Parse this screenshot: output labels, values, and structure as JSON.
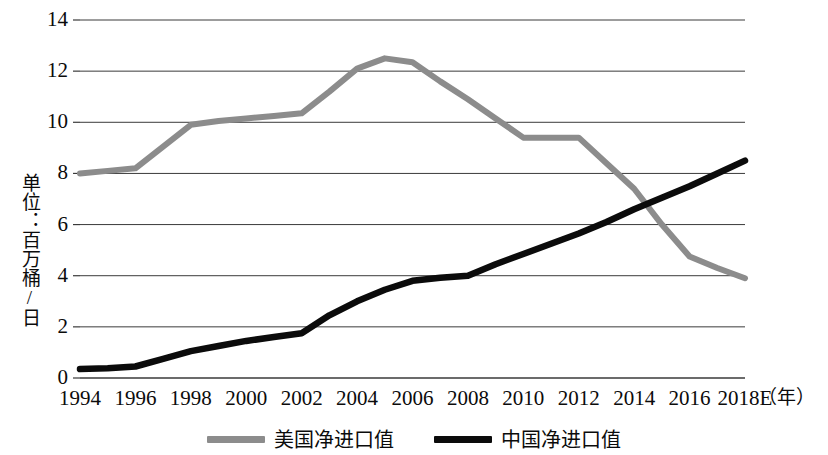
{
  "chart_data": {
    "type": "line",
    "title": "",
    "xlabel": "年",
    "ylabel": "单位：百万桶/日",
    "x": [
      1994,
      1995,
      1996,
      1997,
      1998,
      1999,
      2000,
      2001,
      2002,
      2003,
      2004,
      2005,
      2006,
      2007,
      2008,
      2009,
      2010,
      2011,
      2012,
      2013,
      2014,
      2015,
      2016,
      2017,
      2018
    ],
    "xtick_labels": [
      "1994",
      "1996",
      "1998",
      "2000",
      "2002",
      "2004",
      "2006",
      "2008",
      "2010",
      "2012",
      "2014",
      "2016",
      "2018E"
    ],
    "xtick_values": [
      1994,
      1996,
      1998,
      2000,
      2002,
      2004,
      2006,
      2008,
      2010,
      2012,
      2014,
      2016,
      2018
    ],
    "ytick_labels": [
      "0",
      "2",
      "4",
      "6",
      "8",
      "10",
      "12",
      "14"
    ],
    "ytick_values": [
      0,
      2,
      4,
      6,
      8,
      10,
      12,
      14
    ],
    "ylim": [
      0,
      14
    ],
    "xlim": [
      1994,
      2018
    ],
    "grid": "horizontal",
    "legend_position": "bottom-center",
    "series": [
      {
        "name": "美国净进口值",
        "color": "#8c8c8c",
        "style": "thick-gray",
        "values": [
          8.0,
          8.1,
          8.2,
          9.05,
          9.9,
          10.05,
          10.15,
          10.25,
          10.35,
          11.2,
          12.1,
          12.5,
          12.35,
          11.6,
          10.9,
          10.15,
          9.4,
          9.4,
          9.4,
          8.4,
          7.4,
          6.0,
          4.75,
          4.3,
          3.9
        ]
      },
      {
        "name": "中国净进口值",
        "color": "#0b0b0b",
        "style": "thick-black",
        "values": [
          0.35,
          0.38,
          0.45,
          0.75,
          1.05,
          1.25,
          1.45,
          1.6,
          1.75,
          2.45,
          3.0,
          3.45,
          3.8,
          3.92,
          4.0,
          4.45,
          4.85,
          5.25,
          5.65,
          6.1,
          6.6,
          7.05,
          7.5,
          8.0,
          8.5
        ]
      }
    ]
  },
  "legend": {
    "items": [
      {
        "label": "美国净进口值",
        "color": "#8c8c8c"
      },
      {
        "label": "中国净进口值",
        "color": "#0b0b0b"
      }
    ]
  },
  "axes": {
    "y_title": "单位：百万桶/日",
    "x_unit": "（年）"
  }
}
